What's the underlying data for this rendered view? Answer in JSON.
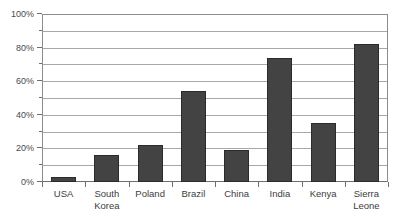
{
  "chart_data": {
    "type": "bar",
    "title": "",
    "xlabel": "",
    "ylabel": "",
    "categories": [
      "USA",
      "South\nKorea",
      "Poland",
      "Brazil",
      "China",
      "India",
      "Kenya",
      "Sierra\nLeone"
    ],
    "values": [
      3,
      16,
      22,
      54,
      19,
      74,
      35,
      82
    ],
    "ylim": [
      0,
      100
    ],
    "ytick_labels": [
      "0%",
      "20%",
      "40%",
      "60%",
      "80%",
      "100%"
    ],
    "ytick_values": [
      0,
      20,
      40,
      60,
      80,
      100
    ],
    "gridline_values": [
      10,
      20,
      30,
      40,
      50,
      60,
      70,
      80,
      90,
      100
    ],
    "minor_tick_values": [
      10,
      30,
      50,
      70,
      90
    ],
    "grid": true,
    "legend": "none",
    "bar_color": "#434343",
    "bar_edge_color": "#2b2b2b",
    "grid_color": "#a8a8a8",
    "axis_color": "#6f6f6f",
    "background": "#ffffff"
  }
}
